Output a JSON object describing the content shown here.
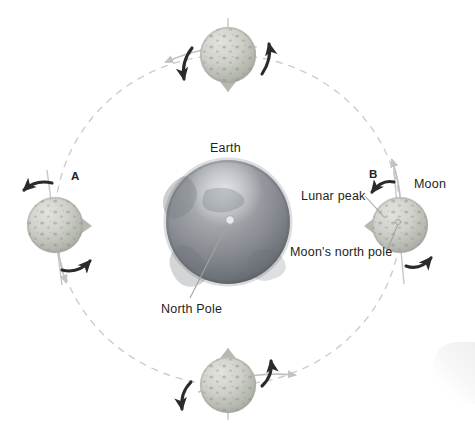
{
  "diagram": {
    "background_color": "#ffffff"
  },
  "labels": {
    "earth": "Earth",
    "north_pole": "North Pole",
    "moon": "Moon",
    "lunar_peak": "Lunar peak",
    "moons_north_pole": "Moon's north pole",
    "position_a": "A",
    "position_b": "B"
  },
  "colors": {
    "earth_light": "#b9bcc0",
    "earth_mid": "#8f9399",
    "earth_dark": "#5d6268",
    "moon_light": "#d6d8d3",
    "moon_mid": "#b9bcb5",
    "moon_dark": "#9ea196",
    "crater": "#8d9086",
    "orbit_dash": "#cfcfcf",
    "arrow_dark": "#2b2b2b",
    "leader_line": "#9b9b9b",
    "axis_line": "#c4c4c4",
    "text": "#231f20"
  },
  "geometry": {
    "earth": {
      "cx": 228,
      "cy": 222,
      "r": 62
    },
    "orbit": {
      "cx": 228,
      "cy": 220,
      "rx": 173,
      "ry": 165
    },
    "moons": [
      {
        "id": "moon-top",
        "cx": 228,
        "cy": 55,
        "r": 28,
        "peak_angle_deg": 90,
        "label": ""
      },
      {
        "id": "moon-left",
        "cx": 55,
        "cy": 225,
        "r": 28,
        "peak_angle_deg": 0,
        "label": "A"
      },
      {
        "id": "moon-bottom",
        "cx": 228,
        "cy": 385,
        "r": 28,
        "peak_angle_deg": 270,
        "label": ""
      },
      {
        "id": "moon-right",
        "cx": 400,
        "cy": 225,
        "r": 28,
        "peak_angle_deg": 180,
        "label": "B"
      }
    ]
  },
  "label_positions": {
    "earth": {
      "x": 210,
      "y": 142
    },
    "north_pole": {
      "x": 161,
      "y": 303
    },
    "moon": {
      "x": 414,
      "y": 178
    },
    "lunar_peak": {
      "x": 301,
      "y": 190
    },
    "moons_north_pole": {
      "x": 290,
      "y": 246
    },
    "position_a": {
      "x": 71,
      "y": 171
    },
    "position_b": {
      "x": 369,
      "y": 169
    }
  },
  "annotations": {
    "rotation_arrow_count": 8,
    "orbit_direction_arrow_count": 4,
    "note": "Each Moon position shows a rotation arrow pair; dashed ellipse is the orbital path; grey line is the Moon's rotation axis."
  }
}
